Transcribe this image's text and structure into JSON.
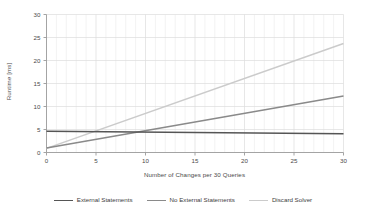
{
  "chart_data": {
    "type": "line",
    "title": "",
    "xlabel": "Number of Changes per 30 Queries",
    "ylabel": "Runtime [ms]",
    "xlim": [
      0,
      30
    ],
    "ylim": [
      0,
      30
    ],
    "xticks": [
      0,
      5,
      10,
      15,
      20,
      25,
      30
    ],
    "yticks": [
      0,
      5,
      10,
      15,
      20,
      25,
      30
    ],
    "xtick_labels": [
      "0",
      "5",
      "10",
      "15",
      "20",
      "25",
      "30"
    ],
    "ytick_labels": [
      "0",
      "5",
      "10",
      "15",
      "20",
      "25",
      "30"
    ],
    "grid": true,
    "grid_minor": true,
    "legend_position": "bottom",
    "x": [
      0,
      30
    ],
    "series": [
      {
        "name": "External Statements",
        "color": "#555555",
        "values": [
          4.6,
          4.1
        ]
      },
      {
        "name": "No External Statements",
        "color": "#8a8a8a",
        "values": [
          1.0,
          12.3
        ]
      },
      {
        "name": "Discard Solver",
        "color": "#cbcbcb",
        "values": [
          0.9,
          23.7
        ]
      }
    ]
  },
  "legend": {
    "items": [
      {
        "label": "External Statements",
        "color": "#555555"
      },
      {
        "label": "No External Statements",
        "color": "#8a8a8a"
      },
      {
        "label": "Discard Solver",
        "color": "#cbcbcb"
      }
    ]
  },
  "axes": {
    "x_label": "Number of Changes per 30 Queries",
    "y_label": "Runtime [ms]",
    "x_tick_labels": [
      "0",
      "5",
      "10",
      "15",
      "20",
      "25",
      "30"
    ],
    "y_tick_labels": [
      "0",
      "5",
      "10",
      "15",
      "20",
      "25",
      "30"
    ]
  },
  "colors": {
    "axis_line": "#9a9a9a",
    "grid_major": "#dcdcdc",
    "grid_minor": "#eeeeee",
    "text": "#4a4a4a",
    "background": "#ffffff"
  }
}
